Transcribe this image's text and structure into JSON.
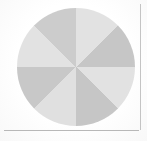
{
  "figure": {
    "width": 147,
    "height": 141,
    "background_color": "#ffffff",
    "frame_line_color": "#c4c4c4",
    "caption": ""
  },
  "chart_data": {
    "type": "pie",
    "title": "",
    "subtitle": "",
    "xlabel": "",
    "ylabel": "",
    "grid": false,
    "legend": "none",
    "labels_shown": false,
    "start_angle_deg": 0,
    "direction": "clockwise",
    "total": 100,
    "center": {
      "x": 76,
      "y": 67
    },
    "radius": 59,
    "categories": [
      "Slice 1",
      "Slice 2",
      "Slice 3",
      "Slice 4",
      "Slice 5",
      "Slice 6",
      "Slice 7",
      "Slice 8"
    ],
    "values": [
      12.5,
      12.5,
      12.5,
      12.5,
      12.5,
      12.5,
      12.5,
      12.5
    ],
    "angles_deg": [
      45,
      45,
      45,
      45,
      45,
      45,
      45,
      45
    ],
    "colors": [
      "#e2e2e2",
      "#c6c6c6",
      "#e2e2e2",
      "#c6c6c6",
      "#e0e0e0",
      "#c8c8c8",
      "#e2e2e2",
      "#cccccc"
    ],
    "palette": {
      "light": "#e2e2e2",
      "mid": "#c6c6c6"
    }
  }
}
